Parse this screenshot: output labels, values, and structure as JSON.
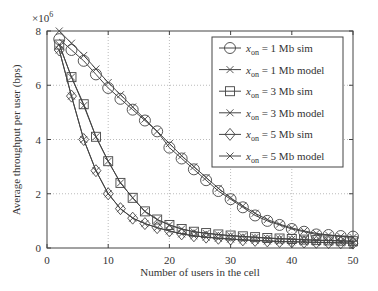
{
  "chart_data": {
    "type": "line",
    "title": "",
    "xlabel": "Number of users in the cell",
    "ylabel": "Average throughput per user (bps)",
    "y_multiplier": "×10",
    "y_multiplier_exp": "6",
    "xlim": [
      0,
      50
    ],
    "ylim": [
      0,
      8
    ],
    "xticks": [
      0,
      10,
      20,
      30,
      40,
      50
    ],
    "yticks": [
      0,
      2,
      4,
      6,
      8
    ],
    "grid": true,
    "legend_position": "upper right",
    "x": [
      2,
      4,
      6,
      8,
      10,
      12,
      14,
      16,
      18,
      20,
      22,
      24,
      26,
      28,
      30,
      32,
      34,
      36,
      38,
      40,
      42,
      44,
      46,
      48,
      50
    ],
    "series": [
      {
        "name": "x_on = 1 Mb sim",
        "legend_var": "x",
        "legend_sub": "on",
        "legend_rest": " = 1 Mb sim",
        "marker": "circle",
        "values": [
          7.7,
          7.3,
          6.9,
          6.4,
          5.9,
          5.5,
          5.1,
          4.7,
          4.3,
          3.7,
          3.3,
          2.9,
          2.5,
          2.1,
          1.8,
          1.5,
          1.2,
          1.0,
          0.85,
          0.7,
          0.6,
          0.5,
          0.48,
          0.44,
          0.42
        ]
      },
      {
        "name": "x_on = 1 Mb model",
        "legend_var": "x",
        "legend_sub": "on",
        "legend_rest": " = 1 Mb model",
        "marker": "x",
        "values": [
          8.0,
          7.55,
          7.1,
          6.6,
          6.1,
          5.65,
          5.2,
          4.75,
          4.3,
          3.85,
          3.4,
          3.0,
          2.6,
          2.2,
          1.85,
          1.55,
          1.28,
          1.05,
          0.88,
          0.74,
          0.63,
          0.54,
          0.48,
          0.43,
          0.39
        ]
      },
      {
        "name": "x_on = 3 Mb sim",
        "legend_var": "x",
        "legend_sub": "on",
        "legend_rest": " = 3 Mb sim",
        "marker": "square",
        "values": [
          7.5,
          6.3,
          5.3,
          4.1,
          3.2,
          2.4,
          1.85,
          1.35,
          1.05,
          0.85,
          0.7,
          0.6,
          0.55,
          0.5,
          0.46,
          0.43,
          0.4,
          0.37,
          0.35,
          0.33,
          0.31,
          0.29,
          0.28,
          0.27,
          0.25
        ]
      },
      {
        "name": "x_on = 3 Mb model",
        "legend_var": "x",
        "legend_sub": "on",
        "legend_rest": " = 3 Mb model",
        "marker": "x",
        "values": [
          7.5,
          6.3,
          5.25,
          4.1,
          3.2,
          2.4,
          1.85,
          1.35,
          1.05,
          0.85,
          0.7,
          0.6,
          0.54,
          0.49,
          0.45,
          0.42,
          0.39,
          0.36,
          0.34,
          0.32,
          0.3,
          0.28,
          0.27,
          0.26,
          0.24
        ]
      },
      {
        "name": "x_on = 5 Mb sim",
        "legend_var": "x",
        "legend_sub": "on",
        "legend_rest": " = 5 Mb sim",
        "marker": "diamond",
        "values": [
          7.3,
          5.6,
          4.0,
          2.85,
          2.0,
          1.45,
          1.1,
          0.9,
          0.75,
          0.63,
          0.52,
          0.45,
          0.4,
          0.36,
          0.33,
          0.3,
          0.28,
          0.26,
          0.24,
          0.23,
          0.22,
          0.21,
          0.2,
          0.19,
          0.18
        ]
      },
      {
        "name": "x_on = 5 Mb model",
        "legend_var": "x",
        "legend_sub": "on",
        "legend_rest": " = 5 Mb model",
        "marker": "x",
        "values": [
          7.3,
          5.6,
          4.0,
          2.85,
          2.0,
          1.45,
          1.1,
          0.9,
          0.75,
          0.63,
          0.52,
          0.45,
          0.4,
          0.36,
          0.33,
          0.3,
          0.28,
          0.26,
          0.24,
          0.23,
          0.22,
          0.21,
          0.2,
          0.19,
          0.18
        ]
      }
    ]
  },
  "colors": {
    "line": "#444444",
    "axis": "#444444",
    "grid": "#bbbbbb",
    "background": "#ffffff"
  }
}
